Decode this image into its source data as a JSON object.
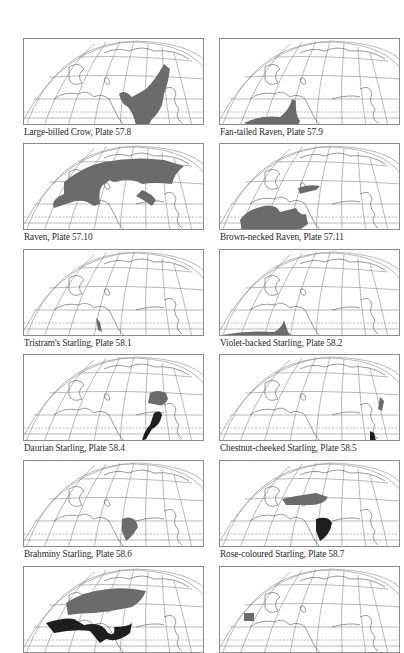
{
  "page": {
    "columns": 2,
    "rows_visible": 6
  },
  "colors": {
    "frame": "#8c8c8c",
    "graticule": "#7a7a7a",
    "coast": "#555555",
    "range_primary": "#6b6b6b",
    "range_secondary": "#1e1e1e",
    "caption": "#2a2a2a"
  },
  "maps": [
    {
      "caption": "Large-billed Crow, Plate 57.8",
      "ranges": [
        "asia-east-south"
      ],
      "shade": [
        "primary"
      ]
    },
    {
      "caption": "Fan-tailed Raven, Plate 57.9",
      "ranges": [
        "africa-arabia-sahel"
      ],
      "shade": [
        "primary"
      ]
    },
    {
      "caption": "Raven, Plate 57.10",
      "ranges": [
        "holarctic-eurasia"
      ],
      "shade": [
        "primary"
      ]
    },
    {
      "caption": "Brown-necked Raven, Plate 57.11",
      "ranges": [
        "sahara-middle-east"
      ],
      "shade": [
        "primary"
      ]
    },
    {
      "caption": "Tristram's Starling, Plate 58.1",
      "ranges": [
        "red-sea-coast"
      ],
      "shade": [
        "primary"
      ]
    },
    {
      "caption": "Violet-backed Starling, Plate 58.2",
      "ranges": [
        "sub-saharan-africa"
      ],
      "shade": [
        "primary"
      ]
    },
    {
      "caption": "Daurian Starling, Plate 58.4",
      "ranges": [
        "north-china-breeding",
        "southeast-asia-wintering"
      ],
      "shade": [
        "primary",
        "secondary"
      ]
    },
    {
      "caption": "Chestnut-cheeked Starling, Plate 58.5",
      "ranges": [
        "japan-breeding",
        "philippines-borneo-wintering"
      ],
      "shade": [
        "primary",
        "secondary"
      ]
    },
    {
      "caption": "Brahminy Starling, Plate 58.6",
      "ranges": [
        "indian-subcontinent"
      ],
      "shade": [
        "primary"
      ]
    },
    {
      "caption": "Rose-coloured Starling, Plate 58.7",
      "ranges": [
        "central-asia-breeding",
        "india-wintering"
      ],
      "shade": [
        "primary",
        "secondary"
      ]
    },
    {
      "caption": "",
      "ranges": [
        "europe-west-asia",
        "mediterranean-middle-east"
      ],
      "shade": [
        "primary",
        "secondary"
      ]
    },
    {
      "caption": "",
      "ranges": [
        "iberia"
      ],
      "shade": [
        "primary"
      ]
    }
  ]
}
